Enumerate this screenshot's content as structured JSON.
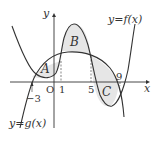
{
  "diagram": {
    "labels": {
      "y_axis": "y",
      "x_axis": "x",
      "origin": "O",
      "f_label": "y=f(x)",
      "g_label": "y=g(x)",
      "region_a": "A",
      "region_b": "B",
      "region_c": "C"
    },
    "ticks": {
      "neg3": "−3",
      "one": "1",
      "five": "5",
      "nine": "9"
    },
    "colors": {
      "curve": "#333333",
      "shade": "#e6e6e6",
      "axis": "#333333"
    }
  }
}
